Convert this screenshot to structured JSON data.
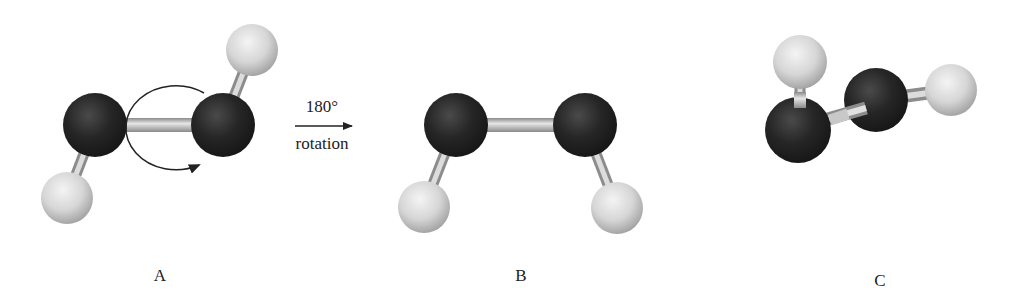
{
  "figure": {
    "molecules": [
      {
        "id": "A",
        "label": "A"
      },
      {
        "id": "B",
        "label": "B"
      },
      {
        "id": "C",
        "label": "C"
      }
    ],
    "transition": {
      "top_text": "180°",
      "bottom_text": "rotation"
    },
    "colors": {
      "heavy_atom": "#1e1e1e",
      "hydrogen_atom": "#d8d8d8",
      "bond": "#bdbdbd",
      "arrow": "#222222",
      "background": "#ffffff"
    }
  }
}
